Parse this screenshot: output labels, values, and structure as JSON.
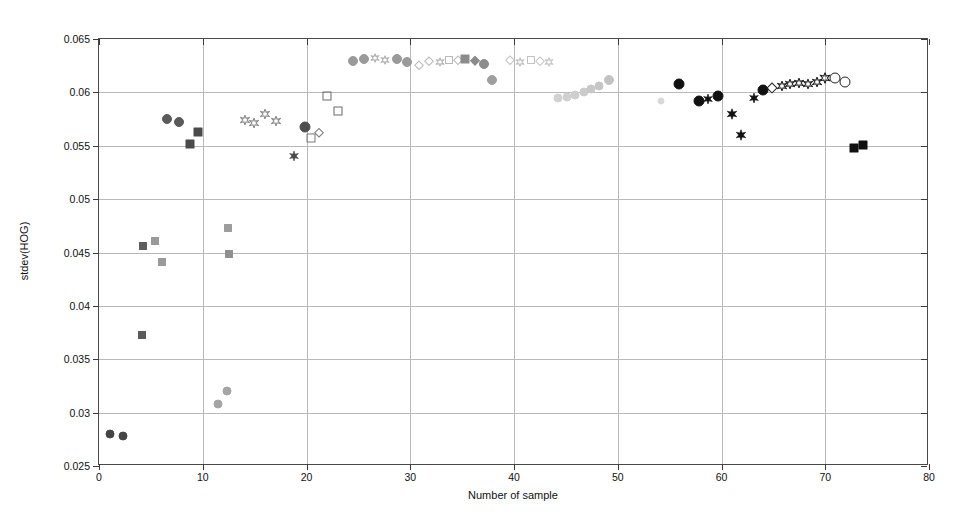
{
  "chart_data": {
    "type": "scatter",
    "title": "",
    "xlabel": "Number of sample",
    "ylabel": "stdev(HOG)",
    "xlim": [
      0,
      80
    ],
    "ylim": [
      0.025,
      0.065
    ],
    "xticks": [
      0,
      10,
      20,
      30,
      40,
      50,
      60,
      70,
      80
    ],
    "xticklabels": [
      "0",
      "10",
      "20",
      "30",
      "40",
      "50",
      "60",
      "70",
      "80"
    ],
    "yticks": [
      0.025,
      0.03,
      0.035,
      0.04,
      0.045,
      0.05,
      0.055,
      0.06,
      0.065
    ],
    "yticklabels": [
      "0.025",
      "0.03",
      "0.035",
      "0.04",
      "0.045",
      "0.05",
      "0.055",
      "0.06",
      "0.065"
    ],
    "grid": true,
    "legend": "none",
    "points": [
      {
        "x": 1.1,
        "y": 0.028,
        "shape": "circle",
        "fill": "#454545",
        "size": 9
      },
      {
        "x": 2.3,
        "y": 0.0278,
        "shape": "circle",
        "fill": "#454545",
        "size": 9
      },
      {
        "x": 4.1,
        "y": 0.0373,
        "shape": "square",
        "fill": "#5a5a5a",
        "size": 8
      },
      {
        "x": 4.2,
        "y": 0.0456,
        "shape": "square",
        "fill": "#5d5d5d",
        "size": 8
      },
      {
        "x": 5.4,
        "y": 0.0461,
        "shape": "square",
        "fill": "#9a9a9a",
        "size": 8
      },
      {
        "x": 6.1,
        "y": 0.0441,
        "shape": "square",
        "fill": "#9a9a9a",
        "size": 8
      },
      {
        "x": 6.6,
        "y": 0.0575,
        "shape": "circle",
        "fill": "#5a5a5a",
        "size": 10
      },
      {
        "x": 7.7,
        "y": 0.0572,
        "shape": "circle",
        "fill": "#5a5a5a",
        "size": 10
      },
      {
        "x": 8.8,
        "y": 0.0552,
        "shape": "square",
        "fill": "#4a4a4a",
        "size": 9
      },
      {
        "x": 9.5,
        "y": 0.0563,
        "shape": "square",
        "fill": "#4a4a4a",
        "size": 9
      },
      {
        "x": 11.5,
        "y": 0.0308,
        "shape": "circle",
        "fill": "#a5a5a5",
        "size": 9
      },
      {
        "x": 12.3,
        "y": 0.032,
        "shape": "circle",
        "fill": "#a5a5a5",
        "size": 9
      },
      {
        "x": 12.4,
        "y": 0.0473,
        "shape": "square",
        "fill": "#9d9d9d",
        "size": 8
      },
      {
        "x": 12.5,
        "y": 0.0449,
        "shape": "square",
        "fill": "#8f8f8f",
        "size": 8
      },
      {
        "x": 14.1,
        "y": 0.0574,
        "shape": "hex",
        "fill": "none",
        "stroke": "#8a8a8a",
        "size": 10
      },
      {
        "x": 14.9,
        "y": 0.0571,
        "shape": "hex",
        "fill": "none",
        "stroke": "#8a8a8a",
        "size": 10
      },
      {
        "x": 16.0,
        "y": 0.058,
        "shape": "hex",
        "fill": "none",
        "stroke": "#8a8a8a",
        "size": 10
      },
      {
        "x": 17.1,
        "y": 0.0573,
        "shape": "hex",
        "fill": "none",
        "stroke": "#8a8a8a",
        "size": 10
      },
      {
        "x": 18.8,
        "y": 0.054,
        "shape": "star",
        "fill": "#4a4a4a",
        "size": 10
      },
      {
        "x": 19.9,
        "y": 0.0568,
        "shape": "circle",
        "fill": "#4d4d4d",
        "size": 11
      },
      {
        "x": 20.4,
        "y": 0.0557,
        "shape": "square",
        "fill": "none",
        "stroke": "#7a7a7a",
        "size": 9
      },
      {
        "x": 21.2,
        "y": 0.0562,
        "shape": "diamond",
        "fill": "none",
        "stroke": "#7a7a7a",
        "size": 10
      },
      {
        "x": 22.0,
        "y": 0.0597,
        "shape": "square",
        "fill": "none",
        "stroke": "#6a6a6a",
        "size": 9
      },
      {
        "x": 23.0,
        "y": 0.0583,
        "shape": "square",
        "fill": "none",
        "stroke": "#6a6a6a",
        "size": 9
      },
      {
        "x": 24.5,
        "y": 0.0629,
        "shape": "circle",
        "fill": "#9a9a9a",
        "size": 10
      },
      {
        "x": 25.5,
        "y": 0.0631,
        "shape": "circle",
        "fill": "#9a9a9a",
        "size": 10
      },
      {
        "x": 26.6,
        "y": 0.0632,
        "shape": "hex",
        "fill": "none",
        "stroke": "#b2b2b2",
        "size": 9
      },
      {
        "x": 27.6,
        "y": 0.063,
        "shape": "hex",
        "fill": "none",
        "stroke": "#b2b2b2",
        "size": 9
      },
      {
        "x": 28.7,
        "y": 0.0631,
        "shape": "circle",
        "fill": "#9a9a9a",
        "size": 10
      },
      {
        "x": 29.7,
        "y": 0.0628,
        "shape": "circle",
        "fill": "#9a9a9a",
        "size": 10
      },
      {
        "x": 30.8,
        "y": 0.0626,
        "shape": "diamond",
        "fill": "none",
        "stroke": "#b8b8b8",
        "size": 9
      },
      {
        "x": 31.8,
        "y": 0.0629,
        "shape": "diamond",
        "fill": "none",
        "stroke": "#b8b8b8",
        "size": 9
      },
      {
        "x": 32.9,
        "y": 0.0628,
        "shape": "hex",
        "fill": "none",
        "stroke": "#b8b8b8",
        "size": 9
      },
      {
        "x": 33.7,
        "y": 0.063,
        "shape": "square",
        "fill": "none",
        "stroke": "#b8b8b8",
        "size": 8
      },
      {
        "x": 34.6,
        "y": 0.063,
        "shape": "diamond",
        "fill": "none",
        "stroke": "#b8b8b8",
        "size": 9
      },
      {
        "x": 35.3,
        "y": 0.0631,
        "shape": "square",
        "fill": "#8c8c8c",
        "size": 9
      },
      {
        "x": 36.2,
        "y": 0.0629,
        "shape": "diamond",
        "fill": "#8c8c8c",
        "size": 10
      },
      {
        "x": 37.1,
        "y": 0.0627,
        "shape": "circle",
        "fill": "#8c8c8c",
        "size": 10
      },
      {
        "x": 37.9,
        "y": 0.0612,
        "shape": "circle",
        "fill": "#9e9e9e",
        "size": 10
      },
      {
        "x": 39.6,
        "y": 0.063,
        "shape": "diamond",
        "fill": "none",
        "stroke": "#c2c2c2",
        "size": 9
      },
      {
        "x": 40.6,
        "y": 0.0628,
        "shape": "hex",
        "fill": "none",
        "stroke": "#c2c2c2",
        "size": 9
      },
      {
        "x": 41.6,
        "y": 0.063,
        "shape": "square",
        "fill": "none",
        "stroke": "#c2c2c2",
        "size": 8
      },
      {
        "x": 42.5,
        "y": 0.0629,
        "shape": "diamond",
        "fill": "none",
        "stroke": "#c6c6c6",
        "size": 9
      },
      {
        "x": 43.4,
        "y": 0.0628,
        "shape": "hex",
        "fill": "none",
        "stroke": "#c6c6c6",
        "size": 9
      },
      {
        "x": 44.2,
        "y": 0.0595,
        "shape": "circle",
        "fill": "#d2d2d2",
        "size": 9
      },
      {
        "x": 45.1,
        "y": 0.0596,
        "shape": "circle",
        "fill": "#d0d0d0",
        "size": 9
      },
      {
        "x": 45.9,
        "y": 0.0598,
        "shape": "circle",
        "fill": "#cecece",
        "size": 9
      },
      {
        "x": 46.7,
        "y": 0.06,
        "shape": "circle",
        "fill": "#cbcbcb",
        "size": 9
      },
      {
        "x": 47.4,
        "y": 0.0603,
        "shape": "circle",
        "fill": "#c8c8c8",
        "size": 9
      },
      {
        "x": 48.2,
        "y": 0.0606,
        "shape": "circle",
        "fill": "#c5c5c5",
        "size": 9
      },
      {
        "x": 49.2,
        "y": 0.0612,
        "shape": "circle",
        "fill": "#c2c2c2",
        "size": 10
      },
      {
        "x": 54.2,
        "y": 0.0592,
        "shape": "circle",
        "fill": "#d8d8d8",
        "size": 7
      },
      {
        "x": 55.9,
        "y": 0.0608,
        "shape": "circle",
        "fill": "#111111",
        "size": 11
      },
      {
        "x": 57.8,
        "y": 0.0592,
        "shape": "circle",
        "fill": "#111111",
        "size": 11
      },
      {
        "x": 58.7,
        "y": 0.0594,
        "shape": "star",
        "fill": "#111111",
        "size": 10
      },
      {
        "x": 59.7,
        "y": 0.0597,
        "shape": "circle",
        "fill": "#111111",
        "size": 11
      },
      {
        "x": 61.0,
        "y": 0.058,
        "shape": "star",
        "fill": "#111111",
        "size": 11
      },
      {
        "x": 61.9,
        "y": 0.056,
        "shape": "star",
        "fill": "#111111",
        "size": 11
      },
      {
        "x": 63.1,
        "y": 0.0595,
        "shape": "star",
        "fill": "#111111",
        "size": 10
      },
      {
        "x": 64.0,
        "y": 0.0602,
        "shape": "circle",
        "fill": "#111111",
        "size": 11
      },
      {
        "x": 64.9,
        "y": 0.0604,
        "shape": "diamond",
        "fill": "none",
        "stroke": "#222222",
        "size": 11
      },
      {
        "x": 65.8,
        "y": 0.0606,
        "shape": "hex",
        "fill": "none",
        "stroke": "#222222",
        "size": 10
      },
      {
        "x": 66.6,
        "y": 0.0608,
        "shape": "hex",
        "fill": "none",
        "stroke": "#222222",
        "size": 10
      },
      {
        "x": 67.5,
        "y": 0.0609,
        "shape": "hex",
        "fill": "none",
        "stroke": "#222222",
        "size": 10
      },
      {
        "x": 68.3,
        "y": 0.0608,
        "shape": "hex",
        "fill": "none",
        "stroke": "#222222",
        "size": 10
      },
      {
        "x": 69.2,
        "y": 0.061,
        "shape": "hex",
        "fill": "none",
        "stroke": "#222222",
        "size": 10
      },
      {
        "x": 70.0,
        "y": 0.0613,
        "shape": "hex",
        "fill": "none",
        "stroke": "#222222",
        "size": 11
      },
      {
        "x": 70.9,
        "y": 0.0613,
        "shape": "circle",
        "fill": "none",
        "stroke": "#222222",
        "size": 11
      },
      {
        "x": 71.9,
        "y": 0.061,
        "shape": "circle",
        "fill": "none",
        "stroke": "#222222",
        "size": 11
      },
      {
        "x": 72.8,
        "y": 0.0548,
        "shape": "square",
        "fill": "#111111",
        "size": 9
      },
      {
        "x": 73.6,
        "y": 0.0551,
        "shape": "square",
        "fill": "#111111",
        "size": 9
      }
    ]
  }
}
